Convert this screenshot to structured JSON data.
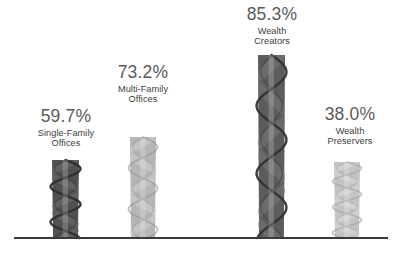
{
  "chart_data": {
    "type": "bar",
    "title": "",
    "subtitle": "",
    "xlabel": "",
    "ylabel": "",
    "grid": false,
    "legend": "none",
    "ylim": [
      0,
      100
    ],
    "categories": [
      "Single-Family Offices",
      "Multi-Family Offices",
      "Wealth Creators",
      "Wealth Preservers"
    ],
    "values": [
      59.7,
      73.2,
      85.3,
      38.0
    ],
    "value_labels": [
      "59.7%",
      "73.2%",
      "85.3%",
      "38.0%"
    ],
    "bar_style": "twisted-ribbon-helix",
    "bar_colors": [
      "#4a4a4a",
      "#b3b3b3",
      "#555555",
      "#c2c2c2"
    ],
    "axis_line_color": "#3a3a3a"
  },
  "bars": [
    {
      "id": "single-family-offices",
      "value_label": "59.7%",
      "name_line1": "Single-Family",
      "name_line2": "Offices",
      "color": "#4a4a4a",
      "color_light": "#6d6d6d",
      "color_dark": "#2e2e2e",
      "x": 52,
      "width": 27,
      "top": 160,
      "label_left": 16,
      "label_top": 108,
      "label_width": 100
    },
    {
      "id": "multi-family-offices",
      "value_label": "73.2%",
      "name_line1": "Multi-Family",
      "name_line2": "Offices",
      "color": "#b3b3b3",
      "color_light": "#cfcfcf",
      "color_dark": "#949494",
      "x": 130,
      "width": 26,
      "top": 137,
      "label_left": 93,
      "label_top": 64,
      "label_width": 100
    },
    {
      "id": "wealth-creators",
      "value_label": "85.3%",
      "name_line1": "Wealth",
      "name_line2": "Creators",
      "color": "#555555",
      "color_light": "#787878",
      "color_dark": "#333333",
      "x": 258,
      "width": 27,
      "top": 55,
      "label_left": 222,
      "label_top": 6,
      "label_width": 100
    },
    {
      "id": "wealth-preservers",
      "value_label": "38.0%",
      "name_line1": "Wealth",
      "name_line2": "Preservers",
      "color": "#c2c2c2",
      "color_light": "#dadada",
      "color_dark": "#a3a3a3",
      "x": 334,
      "width": 26,
      "top": 162,
      "label_left": 300,
      "label_top": 106,
      "label_width": 100
    }
  ],
  "axis": {
    "baseline_y": 238,
    "baseline_left": 14,
    "baseline_right": 388,
    "baseline_thickness": 2,
    "color": "#3a3a3a"
  }
}
